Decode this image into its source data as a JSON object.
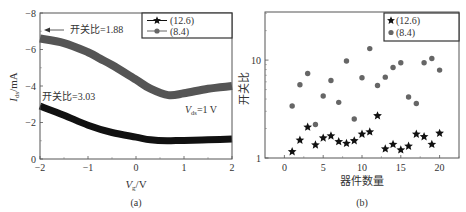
{
  "chart_data": [
    {
      "panel": "(a)",
      "type": "line",
      "title": "",
      "xlabel": "V_g/V",
      "ylabel": "I_ds/mA",
      "xlim": [
        -2,
        2
      ],
      "ylim": [
        0,
        -8
      ],
      "xticks": [
        -2,
        -1,
        0,
        1,
        2
      ],
      "yticks": [
        -8,
        -6,
        -4,
        -2,
        0
      ],
      "grid": false,
      "legend_position": "upper right",
      "annotations": [
        {
          "text": "开关比=1.88",
          "arrow": true,
          "target": "(8.4) curve at V_g=-2"
        },
        {
          "text": "开关比=3.03",
          "arrow": false
        },
        {
          "text": "V_ds=1 V",
          "arrow": false
        }
      ],
      "series": [
        {
          "name": "(12.6)",
          "marker": "star",
          "color": "#111111",
          "x": [
            -2.0,
            -1.5,
            -1.0,
            -0.5,
            0.0,
            0.3,
            0.65,
            1.0,
            1.5,
            2.0
          ],
          "y": [
            -2.9,
            -2.4,
            -1.85,
            -1.45,
            -1.2,
            -1.05,
            -1.0,
            -1.02,
            -1.05,
            -1.1
          ]
        },
        {
          "name": "(8.4)",
          "marker": "circle",
          "color": "#555555",
          "x": [
            -2.0,
            -1.5,
            -1.0,
            -0.75,
            -0.5,
            0.0,
            0.3,
            0.67,
            1.0,
            1.5,
            2.0
          ],
          "y": [
            -6.6,
            -6.35,
            -5.85,
            -5.5,
            -5.15,
            -4.35,
            -3.85,
            -3.5,
            -3.6,
            -3.85,
            -4.0
          ]
        }
      ]
    },
    {
      "panel": "(b)",
      "type": "scatter",
      "title": "",
      "xlabel": "器件数量",
      "ylabel": "开关比",
      "xlim": [
        -2.5,
        22.5
      ],
      "ylim": [
        1,
        31
      ],
      "yscale": "log",
      "xticks": [
        0,
        5,
        10,
        15,
        20
      ],
      "yticks": [
        1,
        10
      ],
      "grid": false,
      "legend_position": "upper right",
      "series": [
        {
          "name": "(12.6)",
          "marker": "star",
          "color": "#111111",
          "x": [
            1,
            2,
            3,
            4,
            5,
            6,
            7,
            8,
            9,
            10,
            11,
            12,
            13,
            14,
            15,
            16,
            17,
            18,
            19,
            20
          ],
          "y": [
            1.16,
            1.52,
            2.07,
            1.36,
            1.6,
            1.68,
            1.47,
            1.41,
            1.5,
            1.75,
            1.85,
            2.7,
            1.24,
            1.38,
            1.21,
            1.32,
            1.75,
            1.65,
            1.38,
            1.79
          ]
        },
        {
          "name": "(8.4)",
          "marker": "circle",
          "color": "#666666",
          "x": [
            1,
            2,
            3,
            4,
            5,
            6,
            7,
            8,
            9,
            10,
            11,
            12,
            13,
            14,
            15,
            16,
            17,
            18,
            19,
            20
          ],
          "y": [
            3.4,
            5.6,
            7.3,
            2.2,
            4.3,
            6.2,
            3.7,
            9.8,
            2.5,
            6.6,
            13.1,
            5.5,
            6.7,
            8.4,
            9.4,
            4.2,
            3.6,
            9.4,
            10.4,
            7.9
          ]
        }
      ]
    }
  ],
  "labels": {
    "panel_a_caption": "(a)",
    "panel_b_caption": "(b)",
    "a_ylabel_main": "I",
    "a_ylabel_sub": "ds",
    "a_ylabel_unit": "/mA",
    "a_xlabel_main": "V",
    "a_xlabel_sub": "g",
    "a_xlabel_unit": "/V",
    "a_annot_188": "开关比=1.88",
    "a_annot_303": "开关比=3.03",
    "a_vds_main": "V",
    "a_vds_sub": "ds",
    "a_vds_rest": "=1 V",
    "b_xlabel": "器件数量",
    "b_ylabel": "开关比",
    "legend_1": "(12.6)",
    "legend_2": "(8.4)"
  }
}
